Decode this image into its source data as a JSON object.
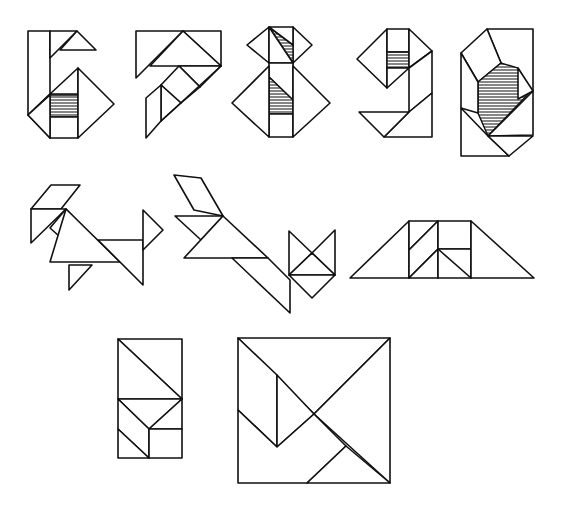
{
  "figures": [
    {
      "id": "digit-6",
      "label": "6"
    },
    {
      "id": "digit-7",
      "label": "7"
    },
    {
      "id": "digit-8",
      "label": "8"
    },
    {
      "id": "digit-9",
      "label": "9"
    },
    {
      "id": "digit-0",
      "label": "0"
    },
    {
      "id": "dog",
      "label": "dog"
    },
    {
      "id": "cat",
      "label": "cat"
    },
    {
      "id": "trapezoid",
      "label": "trapezoid"
    },
    {
      "id": "rectangle",
      "label": "rectangle"
    },
    {
      "id": "square",
      "label": "square"
    }
  ],
  "colors": {
    "ink": "#111111",
    "paper": "#ffffff",
    "hatch": "#222222"
  }
}
